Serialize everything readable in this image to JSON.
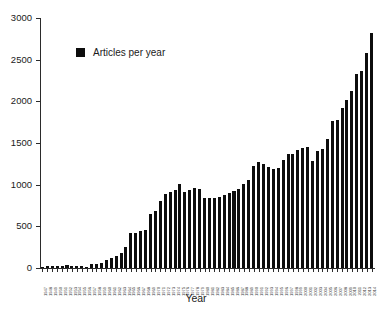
{
  "chart_data": {
    "type": "bar",
    "title": "",
    "xlabel": "Year",
    "ylabel": "",
    "ylim": [
      0,
      3000
    ],
    "yticks": [
      0,
      500,
      1000,
      1500,
      2000,
      2500,
      3000
    ],
    "grid": false,
    "legend_position": "top-left",
    "legend": [
      "Articles per year"
    ],
    "series_name": "Articles per year",
    "bar_color": "#0d0d0d",
    "categories": [
      "1947",
      "1948",
      "1949",
      "1950",
      "1951",
      "1952",
      "1953",
      "1954",
      "1955",
      "1956",
      "1957",
      "1958",
      "1959",
      "1960",
      "1961",
      "1962",
      "1963",
      "1964",
      "1965",
      "1966",
      "1967",
      "1968",
      "1969",
      "1970",
      "1971",
      "1972",
      "1973",
      "1974",
      "1975",
      "1976",
      "1977",
      "1978",
      "1979",
      "1980",
      "1981",
      "1982",
      "1983",
      "1984",
      "1985",
      "1986",
      "1987",
      "1988",
      "1989",
      "1990",
      "1991",
      "1992",
      "1993",
      "1994",
      "1995",
      "1996",
      "1997",
      "1998",
      "1999",
      "2000",
      "2001",
      "2002",
      "2003",
      "2004",
      "2005",
      "2006"
    ],
    "values": [
      12,
      20,
      25,
      28,
      30,
      32,
      30,
      28,
      26,
      18,
      45,
      50,
      55,
      95,
      120,
      140,
      185,
      250,
      415,
      420,
      440,
      460,
      650,
      685,
      810,
      890,
      915,
      940,
      1005,
      910,
      935,
      960,
      950,
      845,
      840,
      845,
      855,
      880,
      905,
      930,
      945,
      1010,
      1060,
      1220,
      1270,
      1250,
      1215,
      1190,
      1195,
      1300,
      1370,
      1365,
      1415,
      1440,
      1455,
      1290,
      1400,
      1430,
      1545,
      1765
    ],
    "values_tail": [
      1780,
      1915,
      2020,
      2125,
      2325,
      2360,
      2580,
      2820
    ],
    "axis_color": "#2b2b2b",
    "background": "#ffffff"
  }
}
